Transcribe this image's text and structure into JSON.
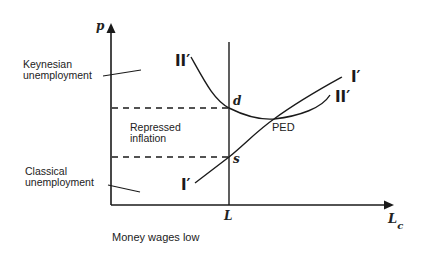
{
  "diagram": {
    "axes": {
      "y_label": "p",
      "x_label": "L",
      "x_label_sub": "c",
      "vertical_line_label": "L"
    },
    "points": {
      "d": "d",
      "s": "s",
      "ped": "PED"
    },
    "curves": {
      "ii_prime_left": "II′",
      "ii_prime_right": "II′",
      "i_prime_right": "I′",
      "i_prime_left": "I′"
    },
    "regions": {
      "keynesian_line1": "Keynesian",
      "keynesian_line2": "unemployment",
      "repressed_line1": "Repressed",
      "repressed_line2": "inflation",
      "classical_line1": "Classical",
      "classical_line2": "unemployment"
    },
    "caption": "Money wages low",
    "colors": {
      "ink": "#1a1a1a",
      "background": "#ffffff"
    }
  }
}
